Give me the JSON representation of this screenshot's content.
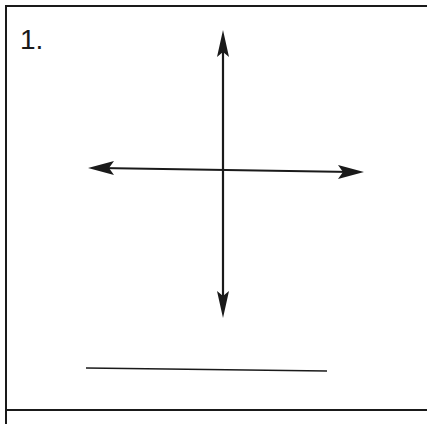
{
  "worksheet": {
    "problem_number": "1.",
    "figure": {
      "type": "intersecting-lines",
      "description": "Two perpendicular lines with arrows at both ends, intersecting at center",
      "vertical_line": {
        "x1": 223,
        "y1": 30,
        "x2": 223,
        "y2": 318
      },
      "horizontal_line": {
        "x1": 88,
        "y1": 168,
        "x2": 364,
        "y2": 172
      },
      "stroke_color": "#1a1a1a"
    },
    "answer_line": {
      "x1": 86,
      "y1": 368,
      "x2": 327,
      "y2": 371
    }
  }
}
